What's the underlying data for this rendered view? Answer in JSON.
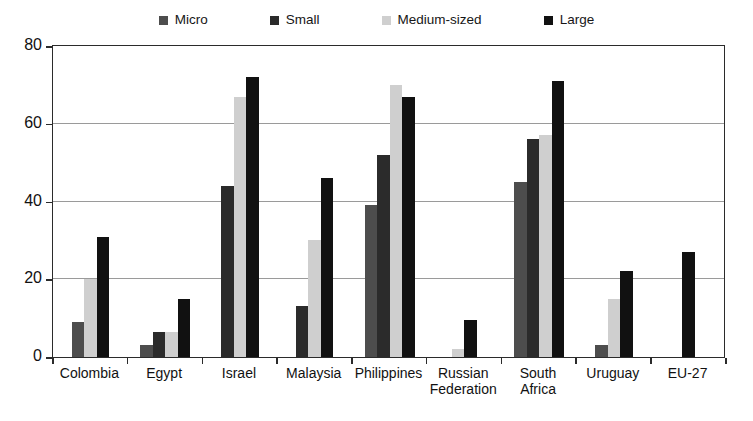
{
  "chart_data": {
    "type": "bar",
    "title": "",
    "subtitle": "",
    "xlabel": "",
    "ylabel": "",
    "ylim": [
      0,
      80
    ],
    "yticks": [
      0,
      20,
      40,
      60,
      80
    ],
    "ytick_labels": [
      "0",
      "20",
      "40",
      "60",
      "80"
    ],
    "grid": true,
    "legend_position": "top",
    "categories": [
      "Colombia",
      "Egypt",
      "Israel",
      "Malaysia",
      "Philippines",
      "Russian\nFederation",
      "South\nAfrica",
      "Uruguay",
      "EU-27"
    ],
    "series": [
      {
        "name": "Micro",
        "color": "#4d4d4d",
        "values": [
          9,
          3,
          null,
          null,
          39,
          null,
          45,
          3,
          null
        ]
      },
      {
        "name": "Small",
        "color": "#2b2b2b",
        "values": [
          null,
          6.5,
          44,
          13,
          52,
          null,
          56,
          null,
          null
        ]
      },
      {
        "name": "Medium-sized",
        "color": "#cfcfcf",
        "values": [
          20,
          6.5,
          67,
          30,
          70,
          2,
          57,
          15,
          null
        ]
      },
      {
        "name": "Large",
        "color": "#111111",
        "values": [
          31,
          15,
          72,
          46,
          67,
          9.5,
          71,
          22,
          27
        ]
      }
    ]
  },
  "legend": {
    "entries": [
      {
        "label": "Micro",
        "color": "#4d4d4d"
      },
      {
        "label": "Small",
        "color": "#2b2b2b"
      },
      {
        "label": "Medium-sized",
        "color": "#cfcfcf"
      },
      {
        "label": "Large",
        "color": "#111111"
      }
    ]
  },
  "axis": {
    "y_tick_labels": [
      "80",
      "60",
      "40",
      "20",
      "0"
    ]
  }
}
